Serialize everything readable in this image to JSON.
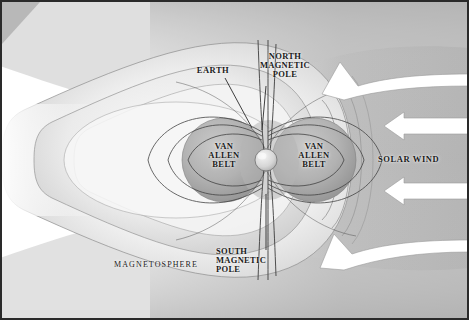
{
  "diagram": {
    "background_color": "#ffffff",
    "frame_color": "#2a2a2a",
    "labels": {
      "earth": "EARTH",
      "north_magnetic_pole": "NORTH\nMAGNETIC\nPOLE",
      "south_magnetic_pole": "SOUTH\nMAGNETIC\nPOLE",
      "van_allen_belt_left": "VAN\nALLEN\nBELT",
      "van_allen_belt_right": "VAN\nALLEN\nBELT",
      "magnetosphere": "MAGNETOSPHERE",
      "solar_wind": "SOLAR WIND"
    },
    "features": {
      "earth_sphere": "earth-sphere",
      "magnetotail": "magnetotail-lobes",
      "bow_shock": "bow-shock-arcs",
      "field_lines": "magnetic-field-lines"
    },
    "arrows": [
      {
        "name": "solar-wind-arrow-top",
        "style": "curved",
        "direction": "left-up",
        "color": "#ffffff"
      },
      {
        "name": "solar-wind-arrow-upper-mid",
        "style": "straight",
        "direction": "left",
        "color": "#ffffff"
      },
      {
        "name": "solar-wind-arrow-lower-mid",
        "style": "straight",
        "direction": "left",
        "color": "#ffffff"
      },
      {
        "name": "solar-wind-arrow-bottom",
        "style": "curved",
        "direction": "left-down",
        "color": "#ffffff"
      }
    ],
    "colors": {
      "solar_wind_field": "#b9b9b9",
      "lobe_light": "#f2f2f2",
      "lobe_mid": "#d8d8d8",
      "belt_grey": "#a9a9a9",
      "line_dark": "#3a3a3a",
      "text": "#1b1b1b"
    }
  }
}
